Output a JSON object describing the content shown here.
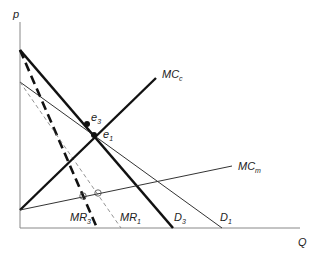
{
  "axes": {
    "y_label": "p",
    "x_label": "Q",
    "origin": [
      20,
      228
    ],
    "y_top": 22,
    "x_right": 300,
    "color": "#888888"
  },
  "curves": [
    {
      "id": "D3",
      "label": "D",
      "sub": "3",
      "from": [
        20,
        50
      ],
      "to": [
        173,
        228
      ],
      "width": 2.6,
      "dash": "",
      "color": "#111111",
      "label_pos": [
        174,
        221
      ]
    },
    {
      "id": "MR3",
      "label": "MR",
      "sub": "3",
      "from": [
        20,
        50
      ],
      "to": [
        97,
        228
      ],
      "width": 2.6,
      "dash": "9,5",
      "color": "#111111",
      "label_pos": [
        70,
        221
      ]
    },
    {
      "id": "D1",
      "label": "D",
      "sub": "1",
      "from": [
        20,
        82
      ],
      "to": [
        222,
        228
      ],
      "width": 1,
      "dash": "",
      "color": "#333333",
      "label_pos": [
        220,
        221
      ]
    },
    {
      "id": "MR1",
      "label": "MR",
      "sub": "1",
      "from": [
        20,
        82
      ],
      "to": [
        121,
        228
      ],
      "width": 0.8,
      "dash": "4,3",
      "color": "#777777",
      "label_pos": [
        120,
        221
      ]
    },
    {
      "id": "MCc",
      "label": "MC",
      "sub": "c",
      "from": [
        20,
        210
      ],
      "to": [
        156,
        78
      ],
      "width": 2.4,
      "dash": "",
      "color": "#111111",
      "label_pos": [
        162,
        78
      ]
    },
    {
      "id": "MCm",
      "label": "MC",
      "sub": "m",
      "from": [
        20,
        210
      ],
      "to": [
        232,
        166
      ],
      "width": 1,
      "dash": "",
      "color": "#333333",
      "label_pos": [
        238,
        170
      ]
    }
  ],
  "points": [
    {
      "id": "e1",
      "label": "e",
      "sub": "1",
      "at": [
        94,
        135
      ],
      "type": "filled",
      "label_pos": [
        103,
        138
      ]
    },
    {
      "id": "e3",
      "label": "e",
      "sub": "3",
      "at": [
        87,
        124
      ],
      "type": "filled",
      "label_pos": [
        91,
        121
      ]
    },
    {
      "id": "mr3_mcm",
      "at": [
        83,
        196
      ],
      "type": "open"
    },
    {
      "id": "mr1_mcm",
      "at": [
        98,
        193
      ],
      "type": "open"
    }
  ]
}
